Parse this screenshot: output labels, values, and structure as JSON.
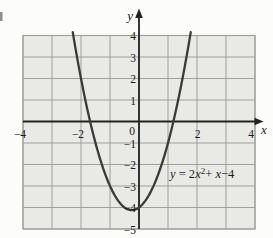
{
  "figure": {
    "description_title": "Graph of a parabola on a shaded grid",
    "annotation": "y = 2x²+ x−4"
  },
  "colors": {
    "background": "#fcfcfb",
    "grid_fill": "#e9e9e6",
    "grid_line": "#9fa19c",
    "axis": "#222220",
    "curve": "#3a3a38",
    "text": "#1c1c1a"
  },
  "equation_label": {
    "t_y": "y",
    "t_eq": " = 2",
    "t_x1": "x",
    "t_sup": "2",
    "t_plus": "+ ",
    "t_x2": "x",
    "t_minus": "−4"
  },
  "chart_data": {
    "type": "line",
    "subtype": "function-plot",
    "title": "",
    "equation_text": "y = 2x² + x − 4",
    "coefficients": {
      "a": 2,
      "b": 1,
      "c": -4
    },
    "xlim": [
      -4,
      4
    ],
    "ylim": [
      -5,
      4
    ],
    "grid": true,
    "x_axis_label": "x",
    "y_axis_label": "y",
    "origin_label": "0",
    "x_tick_labels": [
      "−4",
      "−2",
      "2",
      "4"
    ],
    "y_tick_labels": [
      "4",
      "3",
      "2",
      "1",
      "−1",
      "−2",
      "−3",
      "−4",
      "−5"
    ],
    "x_range_shown": [
      -2.285,
      1.785
    ],
    "key_points": {
      "vertex": [
        -0.25,
        -4.125
      ],
      "y_intercept": [
        0,
        -4
      ],
      "x_intercepts": [
        -1.686,
        1.186
      ]
    },
    "annotations": [
      {
        "text": "y = 2x²+ x−4",
        "approx_position_data_coords": [
          1.07,
          -2.6
        ]
      }
    ]
  }
}
